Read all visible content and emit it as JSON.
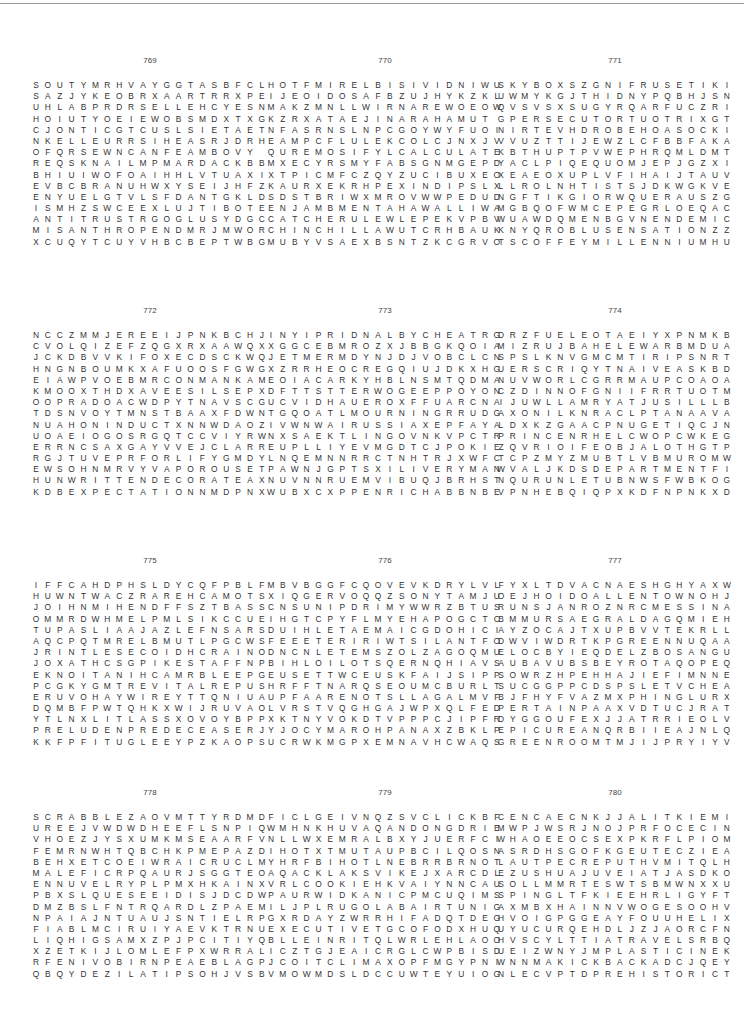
{
  "page": {
    "puzzles": [
      {
        "number": "769",
        "x": 30,
        "y": 68,
        "rows": [
          "SOUTYMRHVAYGGTASBFCL",
          "SAZJYKEOBRXAARTRRXPE",
          "UHLABPRDRSELLEHCYESN",
          "HOIUTYOEIEWOBSMDXTXG",
          "CJONTICGTCUSLSIETAET",
          "NKELLEURRSIHEASRJDRH",
          "OFQRSEWNCANFEAMBOVY ",
          "REQSKNAILMPMARDACKBB",
          "BHIUIWOFOAIHHLVTUAXI",
          "EVBCBRANUHWXYSEIJHFZ",
          "ENYUELGTVLSFDANTGKLD",
          "ISMHZSWCEEXLUJTIBOTE",
          "ANTITRUSTRGOGLUSYDGC",
          "MISANTHROPENDMRJMWOR",
          "XCUQYTCUYVHBCBEPTWBG"
        ]
      },
      {
        "number": "770",
        "x": 265,
        "y": 68,
        "rows": [
          "HOTFMIRELBISIVIDNIWU",
          "IJEOIDOSAFBZUJHYKZKL",
          "MAKZMNLLWIRNAREWOEOW",
          "KZRXATAEJINARAHAMUT ",
          "NFASRNSLNPCGOYWYFUOI",
          "EAMPCFLULEKCOLCJNXJV",
          "QUREMOSIFYLCALCULATE",
          "MXECYRSMYFABSGNMGEPD",
          "XTPICMFCZQYZUCIBUXEO",
          "KAURXEKRHPEXINDIPSLX",
          "SDSTBRIWXMROVWWPEDUD",
          "ENJAMBMENTAHAWALLIWA",
          "CATCHERULEWLEPEKVPBV",
          "CHINCHILLAWUTCRHBAUK",
          "MUBYVSAEXBSNTZKCGRVO"
        ]
      },
      {
        "number": "771",
        "x": 495,
        "y": 68,
        "rows": [
          "SKYBOXSZGNIFRUSETIKI",
          "UWMYKGJTHIDNYPQBHJSN",
          "QVSVSXSUGYRQARFUCZRI",
          "GPERSECUTORTUOTRIXGT",
          "NIRTEVHDROBEHOASOCKI",
          "VVUZTTIJEWZLCFBBFAKA",
          "KBTHUPTPVWEPHRQMLDMT",
          "YACLPIQEQUOMJEPJGZXI",
          "XEAEOXUPLVFIHAIJTAUV",
          "LLROLNHTISTSJDKWGKVE",
          "NGFTIKGIORWQUERAUSZG",
          "MGBQOFWMCEPEGRLOEQAC",
          "WUAWDQMENBGVNENDEMIC",
          "KNYQROBLUSENSATIONZZ",
          "TSCOFFEYMILLENNIUMHU"
        ]
      },
      {
        "number": "772",
        "x": 30,
        "y": 318,
        "rows": [
          "NCCZMMJEREEIJPNKBCHJ",
          "CVOLQIZEFZQGXRXAAWQX",
          "JCKDBVVKIFOXECDSCKWQ",
          "HNGNBOUMKXAFUOOSFGWG",
          "EIAWPVOEBMRCONMANKAM",
          "KMOOXTHDXAVEESILSEPX",
          "OOPRADOACWDPYTNAVSCG",
          "TDSNVOYTMNSTBAAXFDWN",
          "NUAHONINDUCTXNNWDAOZ",
          "UOAEIOGOSRGQTCCVIYRW",
          "ERRNCSAXGAYVVEJCLARR",
          "RGJTUVEPRFORLIFYGMDY",
          "EWSOHNMRVYVAPOROUSET",
          "HUNWRITTENDECORATEAX",
          "KDBEXPECTATIONNMDPNX"
        ]
      },
      {
        "number": "773",
        "x": 265,
        "y": 318,
        "rows": [
          "INYIPRIDNALBYCHEATRG",
          "XGGCEBMROZXJBBGKQOIA",
          "JETMERMDYNJDJVOBCLCN",
          "XZRRHEOCREGQIUJDKXHG",
          "EOIACARKYHBLNSMTQDMA",
          "DFTTSTTERWOGEEPPOYON",
          "UCVIDHAUEROXFFUARCNA",
          "TGQOATLMOURNINGRRUDG",
          "IVWNWAIRUSSIAXEPFAYA",
          "NXSAEKTLINGOVNKVPCTR",
          "EUPLLIYEVMGDTCJPOKIE",
          "LNQEMNNRRCTNHTRJXWFC",
          "PAWNJGPTSXILIVERYMAN",
          "NUVNNRUEMVIBUQJBRHST",
          "WUBXCXPPENRICHABBNBE"
        ]
      },
      {
        "number": "774",
        "x": 495,
        "y": 318,
        "rows": [
          "DRZFUELEOTAEIYXPNMKB",
          "MIZRUJBAHELEWARBMDUA",
          "SPSLKNVGMCMTIRIPSNRT",
          "UERSCRIQYTNAIVEASKBD",
          "NUVWORLCGRRMAUPCOAOA",
          "CZDINNOFGNIIFRRTUOTM",
          "IJUWLLAMRYATJUSILLLB",
          "AXONILKNRACLPTANAAVA",
          "LDXKZGAACPNUGETIQCJN",
          "PRINCENRHELCWOPCWKEG",
          "ZQVRIOIFEOBJALOTHGTP",
          "TCPZMYZMUBTLVBMUROMW",
          "WVALJKDSDEPARTMENTFI",
          "NQURUNLETUBNWSFWBKOG",
          "VPNHEBQIQPXKDFNPNKXD"
        ]
      },
      {
        "number": "775",
        "x": 30,
        "y": 568,
        "rows": [
          "IFFCAHDPHSLDYCQFPBLF",
          "HUWNTWACZRAREHCAMOTS",
          "JOIHNMIHENDFFSZTBASS",
          "OMMRDWHMELPMLSIKCCUE",
          "TUPASLIAAJAZLEFNSARS",
          "AQCPQTMRELBMUTLPGCWS",
          "JRINTLESECOIDHCRAINO",
          "JOXATHCSGPIKESTAFFNP",
          "EKNOITANIHCAMRBLEEPG",
          "PCGKYGMTREVITALREPUS",
          "ERUVOHAYWIREYTTQNIUA",
          "DQMBFPWTQHKXWIJRUVAO",
          "YTLNXLITLASSXOVOYBPP",
          "PRELUDENPREDECEASERJ",
          "KKFPFITUGLEEYPZKAOPS"
        ]
      },
      {
        "number": "776",
        "x": 265,
        "y": 568,
        "rows": [
          "MBVBGGFCQOVEVKDRYLVL",
          "XIQGERVOQQZSONYTAMJU",
          "CNSUNIPDRIMYWWRZBTUS",
          "IHGTCPYFLMYEHAPOGCTC",
          "DUIHLETAEMAICGDOHICI",
          "FEEETERIRIWTSILANTFO",
          "DNCNLETEMSZOLZAGOQMU",
          "BIHLOILOTSQERNQHIAVS",
          "EUSETTWCEUSKFAIJSIPP",
          "HRFFTNARQSEOUMCBURLT",
          "UPFAARENOTSLLAGALMVF",
          "LVRSTVQGHGAJWPXQLFED",
          "XKTNYVOKDTVPPPCJIPFR",
          "YJOCYMAROHPANAXZBKLP",
          "UCRWKMGPXEMNAVHCWAQS"
        ]
      },
      {
        "number": "777",
        "x": 495,
        "y": 568,
        "rows": [
          "FYXLTDVACNAESHGHYAXW",
          "OEJHOIDOALLENTOWNOHJ",
          "RUNSJANROZNRCMESSINA",
          "BMMURSAEGRALDAGQMIEH",
          "AYZOCAJTXUPBVVTEKRLL",
          "DWVIWDRTKPGREENNUQAA",
          "ELOCBYIEQDELZBOSANGU",
          "AUBAVUBSBEYROTAQOPEQ",
          "SOWRZHPEHHAJIEFIMNNE",
          "SUCGGPPCDSPSLETVCHEA",
          "BJFHYFVAZMXPHINGLURX",
          "PERTAINPAAXVDTUCJRAT",
          "DYGGOUFEXJJATRRIEOLV",
          "EPICUREANQRBIIEAJNLQ",
          "GREENROOMTMJIJPRYIYV"
        ]
      },
      {
        "number": "778",
        "x": 30,
        "y": 800,
        "rows": [
          "SCRABBLEZAOVMTTYRDMD",
          "UREEJVWDWDHEEFLSNPIQ",
          "VHOEZJYSXUMKMSEAARFV",
          "FEMRNWHTQBCHKPMEPAZD",
          "BEHXETCOEIWRAICRUCLM",
          "MALEFICRPQAURJSGGTEO",
          "ENNUVELRYPLPMXHKAINX",
          "PBXSLQUESEEIDISJDCDW",
          "DMZBSLFNTRQARDLZPAEM",
          "NPAIAJNTUAUJSNTIELRP",
          "FIABLMCIRUIYAEVKTRNU",
          "LIQHIGSAMXZPJPCITIYQ",
          "XZETKIJLOMLEFPXWRRAL",
          "RFENIVOBIRNPEAEBLAGP",
          "QBQYDEZILATIPSOHJVSB"
        ]
      },
      {
        "number": "779",
        "x": 265,
        "y": 800,
        "rows": [
          "FICLGEIVNQZSVCLICKBF",
          "WMHNKHUVAQANDONGDRIE",
          "NLLWXEMRALBXYJUERFCI",
          "IHOTXTMUTAUPBCILQOSN",
          "YHRFBIHOTLNEBRRBRNOT",
          "AQACKLAKSVIKEJXARCDL",
          "VRLCOOKIEHKVAIYNNCAU",
          "PAURWIDKANICPMCUQIMS",
          "ILJPLRUGOLABAIRTUNIG",
          "GXRDAYZWRRHIFADQTDEG",
          "EXECUTIVETGCOFODXHUQ",
          "BLLEINRITQLWRLEHLAOO",
          "ICZTGJEAICRGLCWPBISD",
          "JCOITCLIMAXOPFMGYPNI",
          "VMOWMDSLDCCUWTEYUIOG"
        ]
      },
      {
        "number": "780",
        "x": 495,
        "y": 800,
        "rows": [
          "CENCAECNKJJALITKIEMI",
          "MWPJWSRJNOJPRFOCECIN",
          "WHAOEEOCSEXPKRFLPIOM",
          "ASRDHSGOFKGEUTECZIEA",
          "LAUTPECREPUTHVMITQLH",
          "EZUSHUAJUVEIATJASDKO",
          "SOLLMMRTESWTSBMWNXXU",
          "SPINGLTFKIEEHRLIGYFT",
          "AXMBXHAINNVWOGESOOHV",
          "HVOIGPGGEAYFOUUHELIX",
          "UYUCURQEHDLJZJAORCFN",
          "HVSCYLTTIATRAVELSRBQ",
          "UEIZWNYJMPLASTICINEK",
          "WNNMAKICKBACKADCJQEY",
          "NLECVPTDPREHISTORICT"
        ]
      }
    ]
  }
}
